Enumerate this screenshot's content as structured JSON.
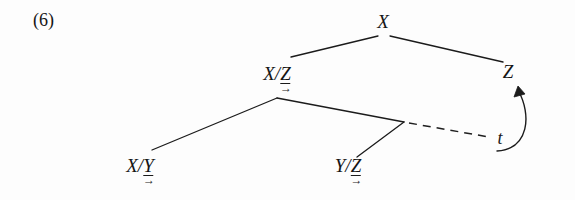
{
  "figure": {
    "example_number": "(6)",
    "kind": "syntactic-derivation-tree",
    "background_color": "#fdfdfd",
    "ink_color": "#151515"
  },
  "nodes": {
    "root": {
      "label": "X",
      "x": 383,
      "y": 12
    },
    "xz": {
      "base": "X/",
      "directional": "Z",
      "arrow": "→",
      "x": 277,
      "y": 64
    },
    "z": {
      "label": "Z",
      "x": 508,
      "y": 62
    },
    "xy": {
      "base": "X/",
      "directional": "Y",
      "arrow": "→",
      "x": 140,
      "y": 156
    },
    "yz": {
      "base": "Y/",
      "directional": "Z",
      "arrow": "→",
      "x": 348,
      "y": 156
    },
    "trace": {
      "label": "t",
      "x": 500,
      "y": 129
    }
  },
  "edges": {
    "root_to_xz": {
      "from": [
        378,
        36
      ],
      "to": [
        291,
        57
      ]
    },
    "root_to_z": {
      "from": [
        390,
        36
      ],
      "to": [
        503,
        62
      ]
    },
    "xz_to_xy": {
      "from": [
        277,
        98
      ],
      "to": [
        152,
        150
      ]
    },
    "xz_to_yz": {
      "from": [
        277,
        98
      ],
      "to": [
        404,
        122
      ]
    },
    "yz_branch": {
      "from": [
        404,
        122
      ],
      "to": [
        357,
        157
      ]
    },
    "trace_dashed": {
      "from": [
        408,
        123
      ],
      "to": [
        489,
        137
      ]
    }
  },
  "movement_arrow": {
    "description": "curved movement arrow from trace position up to Z",
    "path": "M 496 152 C 528 150 530 116 517 88",
    "arrowhead_at": [
      517,
      86
    ]
  }
}
